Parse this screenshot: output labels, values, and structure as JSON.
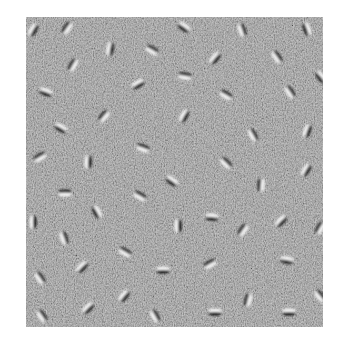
{
  "stimulus": {
    "type": "gabor-field-on-noise",
    "background_color": "#8a8a8a",
    "light_color": "#f4f4f4",
    "dark_color": "#1c1c1c",
    "bounds": {
      "x": 26,
      "y": 17,
      "width": 297,
      "height": 310
    },
    "gabors": [
      {
        "x": 33,
        "y": 30,
        "angle": 60
      },
      {
        "x": 67,
        "y": 28,
        "angle": 55
      },
      {
        "x": 110,
        "y": 49,
        "angle": 80
      },
      {
        "x": 73,
        "y": 65,
        "angle": 60
      },
      {
        "x": 46,
        "y": 92,
        "angle": -20
      },
      {
        "x": 104,
        "y": 116,
        "angle": 50
      },
      {
        "x": 184,
        "y": 27,
        "angle": -35
      },
      {
        "x": 152,
        "y": 50,
        "angle": -30
      },
      {
        "x": 215,
        "y": 58,
        "angle": 50
      },
      {
        "x": 185,
        "y": 76,
        "angle": -10
      },
      {
        "x": 138,
        "y": 84,
        "angle": 30
      },
      {
        "x": 226,
        "y": 95,
        "angle": -30
      },
      {
        "x": 184,
        "y": 116,
        "angle": 60
      },
      {
        "x": 242,
        "y": 30,
        "angle": -70
      },
      {
        "x": 307,
        "y": 29,
        "angle": -70
      },
      {
        "x": 277,
        "y": 57,
        "angle": -55
      },
      {
        "x": 321,
        "y": 77,
        "angle": -50
      },
      {
        "x": 290,
        "y": 92,
        "angle": -55
      },
      {
        "x": 61,
        "y": 128,
        "angle": -30
      },
      {
        "x": 40,
        "y": 157,
        "angle": 30
      },
      {
        "x": 88,
        "y": 162,
        "angle": 88
      },
      {
        "x": 65,
        "y": 193,
        "angle": 0
      },
      {
        "x": 97,
        "y": 212,
        "angle": -60
      },
      {
        "x": 143,
        "y": 148,
        "angle": -20
      },
      {
        "x": 172,
        "y": 181,
        "angle": -35
      },
      {
        "x": 140,
        "y": 196,
        "angle": -30
      },
      {
        "x": 212,
        "y": 217,
        "angle": -5
      },
      {
        "x": 253,
        "y": 135,
        "angle": -60
      },
      {
        "x": 307,
        "y": 131,
        "angle": 70
      },
      {
        "x": 226,
        "y": 163,
        "angle": -45
      },
      {
        "x": 306,
        "y": 170,
        "angle": 60
      },
      {
        "x": 261,
        "y": 185,
        "angle": 85
      },
      {
        "x": 33,
        "y": 222,
        "angle": 90
      },
      {
        "x": 64,
        "y": 238,
        "angle": -70
      },
      {
        "x": 82,
        "y": 267,
        "angle": 45
      },
      {
        "x": 40,
        "y": 278,
        "angle": -55
      },
      {
        "x": 88,
        "y": 308,
        "angle": 45
      },
      {
        "x": 42,
        "y": 316,
        "angle": -55
      },
      {
        "x": 178,
        "y": 226,
        "angle": 90
      },
      {
        "x": 125,
        "y": 252,
        "angle": -30
      },
      {
        "x": 163,
        "y": 270,
        "angle": 0
      },
      {
        "x": 210,
        "y": 264,
        "angle": 30
      },
      {
        "x": 124,
        "y": 296,
        "angle": 50
      },
      {
        "x": 155,
        "y": 316,
        "angle": -60
      },
      {
        "x": 215,
        "y": 312,
        "angle": 0
      },
      {
        "x": 243,
        "y": 230,
        "angle": 55
      },
      {
        "x": 281,
        "y": 221,
        "angle": 45
      },
      {
        "x": 320,
        "y": 228,
        "angle": 60
      },
      {
        "x": 287,
        "y": 260,
        "angle": -10
      },
      {
        "x": 248,
        "y": 300,
        "angle": 75
      },
      {
        "x": 289,
        "y": 312,
        "angle": 0
      },
      {
        "x": 320,
        "y": 296,
        "angle": -50
      }
    ]
  }
}
